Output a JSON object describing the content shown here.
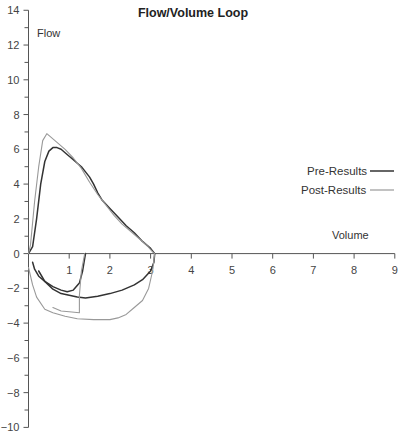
{
  "chart_data": {
    "type": "line",
    "title": "Flow/Volume Loop",
    "xlabel": "Volume",
    "ylabel": "Flow",
    "xlim": [
      0,
      9
    ],
    "ylim": [
      -10,
      14
    ],
    "x_ticks": [
      1,
      2,
      3,
      4,
      5,
      6,
      7,
      8,
      9
    ],
    "y_ticks": [
      -10,
      -8,
      -6,
      -4,
      -2,
      0,
      2,
      4,
      6,
      8,
      10,
      12,
      14
    ],
    "grid": false,
    "legend_position": "right",
    "series": [
      {
        "name": "Pre-Results",
        "color": "#333333",
        "segments": [
          [
            [
              0,
              0
            ],
            [
              0.1,
              0.4
            ],
            [
              0.2,
              2.0
            ],
            [
              0.3,
              4.0
            ],
            [
              0.4,
              5.3
            ],
            [
              0.5,
              5.9
            ],
            [
              0.6,
              6.1
            ],
            [
              0.7,
              6.1
            ],
            [
              0.8,
              6.0
            ],
            [
              0.9,
              5.8
            ],
            [
              1.0,
              5.6
            ],
            [
              1.1,
              5.4
            ],
            [
              1.2,
              5.2
            ],
            [
              1.3,
              5.0
            ],
            [
              1.4,
              4.7
            ],
            [
              1.5,
              4.4
            ],
            [
              1.6,
              4.0
            ],
            [
              1.7,
              3.5
            ],
            [
              1.8,
              3.1
            ],
            [
              2.0,
              2.6
            ],
            [
              2.2,
              2.1
            ],
            [
              2.4,
              1.6
            ],
            [
              2.6,
              1.2
            ],
            [
              2.8,
              0.7
            ],
            [
              3.0,
              0.3
            ],
            [
              3.1,
              0.0
            ]
          ],
          [
            [
              3.1,
              0.0
            ],
            [
              3.08,
              -0.5
            ],
            [
              3.0,
              -1.0
            ],
            [
              2.8,
              -1.5
            ],
            [
              2.6,
              -1.8
            ],
            [
              2.3,
              -2.1
            ],
            [
              2.0,
              -2.3
            ],
            [
              1.7,
              -2.45
            ],
            [
              1.4,
              -2.55
            ],
            [
              1.2,
              -2.5
            ],
            [
              1.0,
              -2.4
            ],
            [
              0.8,
              -2.3
            ],
            [
              0.6,
              -2.05
            ],
            [
              0.4,
              -1.6
            ],
            [
              0.25,
              -1.3
            ],
            [
              0.15,
              -0.9
            ],
            [
              0.1,
              -0.5
            ]
          ],
          [
            [
              0.25,
              -1.0
            ],
            [
              0.4,
              -1.6
            ],
            [
              0.6,
              -1.9
            ],
            [
              0.8,
              -2.1
            ],
            [
              0.95,
              -2.2
            ],
            [
              1.1,
              -2.1
            ],
            [
              1.25,
              -1.7
            ],
            [
              1.33,
              -1.0
            ],
            [
              1.37,
              -0.4
            ],
            [
              1.4,
              0.0
            ]
          ]
        ]
      },
      {
        "name": "Post-Results",
        "color": "#999999",
        "segments": [
          [
            [
              0,
              0
            ],
            [
              0.05,
              0.5
            ],
            [
              0.15,
              3.0
            ],
            [
              0.25,
              5.0
            ],
            [
              0.35,
              6.5
            ],
            [
              0.45,
              6.9
            ],
            [
              0.55,
              6.7
            ],
            [
              0.7,
              6.4
            ],
            [
              0.9,
              6.0
            ],
            [
              1.1,
              5.5
            ],
            [
              1.3,
              4.9
            ],
            [
              1.5,
              4.1
            ],
            [
              1.7,
              3.4
            ],
            [
              1.9,
              2.8
            ],
            [
              2.1,
              2.2
            ],
            [
              2.3,
              1.7
            ],
            [
              2.5,
              1.3
            ],
            [
              2.7,
              0.9
            ],
            [
              2.9,
              0.5
            ],
            [
              3.05,
              0.1
            ],
            [
              3.1,
              0.0
            ]
          ],
          [
            [
              3.1,
              0.0
            ],
            [
              3.05,
              -1.0
            ],
            [
              2.95,
              -2.0
            ],
            [
              2.8,
              -2.7
            ],
            [
              2.6,
              -3.1
            ],
            [
              2.4,
              -3.5
            ],
            [
              2.2,
              -3.7
            ],
            [
              2.0,
              -3.8
            ],
            [
              1.6,
              -3.8
            ],
            [
              1.2,
              -3.75
            ],
            [
              0.9,
              -3.6
            ],
            [
              0.6,
              -3.4
            ],
            [
              0.4,
              -3.2
            ],
            [
              0.2,
              -2.5
            ],
            [
              0.1,
              -1.8
            ],
            [
              0.0,
              -0.8
            ]
          ],
          [
            [
              0.6,
              -3.1
            ],
            [
              0.8,
              -3.3
            ],
            [
              1.0,
              -3.35
            ],
            [
              1.25,
              -3.4
            ],
            [
              1.25,
              -2.4
            ],
            [
              1.3,
              -1.0
            ],
            [
              1.38,
              0.0
            ]
          ]
        ]
      }
    ],
    "annotations": []
  }
}
